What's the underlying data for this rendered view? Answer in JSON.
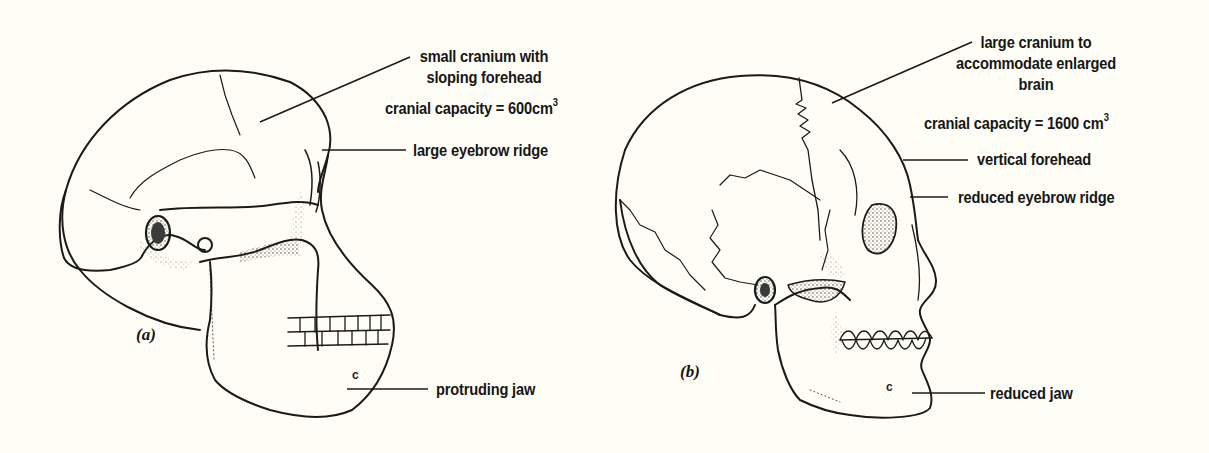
{
  "figure": {
    "background": "#fffef6",
    "ink_color": "#161616",
    "panels": [
      {
        "id": "a",
        "tag": "(a)",
        "subject": "ape-like skull",
        "labels": {
          "cranium": [
            "small cranium with",
            "sloping forehead"
          ],
          "capacity_prefix": "cranial capacity = 600cm",
          "capacity_sup": "3",
          "eyebrow": "large eyebrow ridge",
          "jaw": "protruding jaw"
        },
        "jaw_mark": "c"
      },
      {
        "id": "b",
        "tag": "(b)",
        "subject": "modern human skull",
        "labels": {
          "cranium": [
            "large cranium to",
            "accommodate enlarged",
            "brain"
          ],
          "capacity_prefix": "cranial capacity = 1600 cm",
          "capacity_sup": "3",
          "forehead": "vertical forehead",
          "eyebrow": "reduced eyebrow ridge",
          "jaw": "reduced jaw"
        },
        "jaw_mark": "c"
      }
    ]
  }
}
